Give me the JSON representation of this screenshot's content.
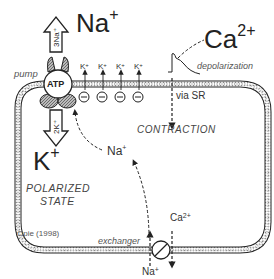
{
  "diagram": {
    "type": "cell-membrane-ion-diagram",
    "labels": {
      "na_top": "Na",
      "na_top_charge": "+",
      "ca_top": "Ca",
      "ca_top_charge": "2+",
      "pump": "pump",
      "atp": "ATP",
      "three_na": "3Na+",
      "two_k": "2K+",
      "k_big": "K",
      "k_big_charge": "+",
      "polarized_line1": "POLARIZED",
      "polarized_line2": "STATE",
      "depolarization": "depolarization",
      "via_sr": "via SR",
      "contraction": "CONTRACTION",
      "na_inside": "Na",
      "na_inside_charge": "+",
      "ca_exchanger": "Ca",
      "ca_exchanger_charge": "2+",
      "na_bottom": "Na",
      "na_bottom_charge": "+",
      "exchanger": "exchanger",
      "citation": "Opie (1998)",
      "k_channel": "K",
      "k_channel_charge": "+"
    },
    "k_channels": 4,
    "negative_charges": 4
  }
}
